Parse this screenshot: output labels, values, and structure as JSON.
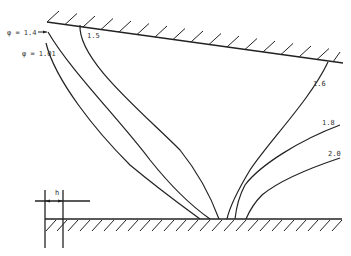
{
  "diagram": {
    "type": "flow-profile-diagram",
    "colors": {
      "background": "#ffffff",
      "line": "#222222",
      "text": "#333333"
    },
    "top_wall": {
      "x1": 47,
      "y1": 22,
      "x2": 343,
      "y2": 63
    },
    "bottom_wall": {
      "x1": 45,
      "y1": 219,
      "x2": 342,
      "y2": 219
    },
    "dimension": {
      "label": "h",
      "left_x": 45,
      "right_x": 63,
      "y": 201
    },
    "curves": [
      {
        "label": "φ = 1.4",
        "label_side": "left"
      },
      {
        "label": "φ = 1.01",
        "label_side": "left"
      },
      {
        "label": "1.5",
        "label_side": "right"
      },
      {
        "label": "1.6",
        "label_side": "right"
      },
      {
        "label": "1.8",
        "label_side": "right"
      },
      {
        "label": "2.0",
        "label_side": "right"
      }
    ]
  }
}
